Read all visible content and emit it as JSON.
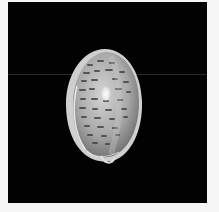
{
  "image": {
    "subject": "cowrie-shell",
    "description": "Photograph of a spotted cowrie shell (dorsal view) on a black background",
    "background_color": "#020202",
    "border_color": "#f6f6f6",
    "shell_colors": {
      "base": "#b9b9b9",
      "highlight": "#ffffff",
      "spots": "#4a4a4a",
      "rim": "#d8d8d8"
    }
  }
}
